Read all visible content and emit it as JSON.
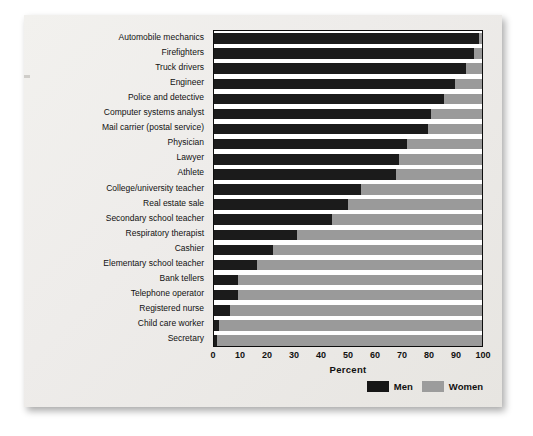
{
  "chart_data": {
    "type": "bar",
    "orientation": "horizontal",
    "stacked": true,
    "title": "",
    "xlabel": "Percent",
    "ylabel": "",
    "xlim": [
      0,
      100
    ],
    "xticks": [
      0,
      10,
      20,
      30,
      40,
      50,
      60,
      70,
      80,
      90,
      100
    ],
    "grid": false,
    "legend_position": "bottom-right",
    "categories": [
      "Automobile mechanics",
      "Firefighters",
      "Truck drivers",
      "Engineer",
      "Police and detective",
      "Computer systems analyst",
      "Mail carrier (postal service)",
      "Physician",
      "Lawyer",
      "Athlete",
      "College/university teacher",
      "Real estate sale",
      "Secondary school teacher",
      "Respiratory therapist",
      "Cashier",
      "Elementary school teacher",
      "Bank tellers",
      "Telephone operator",
      "Registered nurse",
      "Child care worker",
      "Secretary"
    ],
    "series": [
      {
        "name": "Men",
        "color": "#1b1b1b",
        "values": [
          99,
          97,
          94,
          90,
          86,
          81,
          80,
          72,
          69,
          68,
          55,
          50,
          44,
          31,
          22,
          16,
          9,
          9,
          6,
          2,
          1
        ]
      },
      {
        "name": "Women",
        "color": "#9a9a9a",
        "values": [
          1,
          3,
          6,
          10,
          14,
          19,
          20,
          28,
          31,
          32,
          45,
          50,
          56,
          69,
          78,
          84,
          91,
          91,
          94,
          98,
          99
        ]
      }
    ]
  },
  "legend": {
    "items": [
      {
        "label": "Men",
        "swatch": "men-swatch"
      },
      {
        "label": "Women",
        "swatch": "women-swatch"
      }
    ]
  },
  "axis": {
    "x_title": "Percent"
  }
}
